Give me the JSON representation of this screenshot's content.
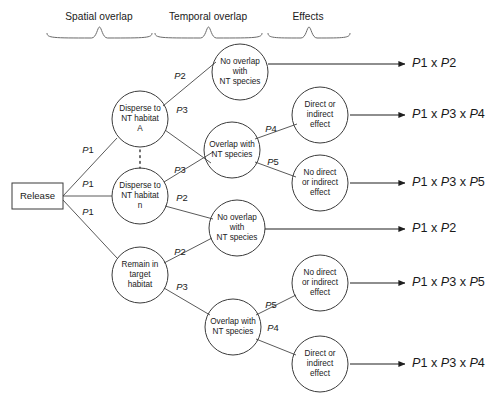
{
  "diagram": {
    "headers": [
      {
        "id": "spatial",
        "label": "Spatial overlap",
        "x": 99,
        "brace_x1": 47,
        "brace_x2": 152
      },
      {
        "id": "temporal",
        "label": "Temporal overlap",
        "x": 208,
        "brace_x1": 155,
        "brace_x2": 262
      },
      {
        "id": "effects",
        "label": "Effects",
        "x": 308,
        "brace_x1": 268,
        "brace_x2": 350
      }
    ],
    "start_box": {
      "label": "Release",
      "x": 12,
      "y": 183,
      "w": 51,
      "h": 26
    },
    "nodes": [
      {
        "id": "disperse-a",
        "lines": [
          "Disperse to",
          "NT habitat",
          "A"
        ],
        "cx": 140,
        "cy": 119,
        "r": 28
      },
      {
        "id": "disperse-n",
        "lines": [
          "Disperse to",
          "NT habitat",
          "n"
        ],
        "cx": 140,
        "cy": 196,
        "r": 28
      },
      {
        "id": "remain-target",
        "lines": [
          "Remain in",
          "target",
          "habitat"
        ],
        "cx": 140,
        "cy": 275,
        "r": 28
      },
      {
        "id": "no-overlap-1",
        "lines": [
          "No overlap",
          "with",
          "NT species"
        ],
        "cx": 240,
        "cy": 72,
        "r": 28
      },
      {
        "id": "overlap-1",
        "lines": [
          "Overlap with",
          "NT species"
        ],
        "cx": 232,
        "cy": 150,
        "r": 28
      },
      {
        "id": "no-overlap-2",
        "lines": [
          "No overlap",
          "with",
          "NT species"
        ],
        "cx": 237,
        "cy": 228,
        "r": 28
      },
      {
        "id": "overlap-2",
        "lines": [
          "Overlap with",
          "NT species"
        ],
        "cx": 233,
        "cy": 327,
        "r": 28
      },
      {
        "id": "effect-direct-1",
        "lines": [
          "Direct or",
          "indirect",
          "effect"
        ],
        "cx": 320,
        "cy": 115,
        "r": 28
      },
      {
        "id": "effect-nodirect-1",
        "lines": [
          "No direct",
          "or indirect",
          "effect"
        ],
        "cx": 320,
        "cy": 183,
        "r": 28
      },
      {
        "id": "effect-nodirect-2",
        "lines": [
          "No direct",
          "or indirect",
          "effect"
        ],
        "cx": 320,
        "cy": 283,
        "r": 28
      },
      {
        "id": "effect-direct-2",
        "lines": [
          "Direct or",
          "indirect",
          "effect"
        ],
        "cx": 320,
        "cy": 364,
        "r": 28
      }
    ],
    "edges": [
      {
        "id": "release-to-disperse-a",
        "x1": 63,
        "y1": 196,
        "x2": 117,
        "y2": 138
      },
      {
        "id": "release-to-disperse-n",
        "x1": 63,
        "y1": 196,
        "x2": 112,
        "y2": 196
      },
      {
        "id": "release-to-remain",
        "x1": 63,
        "y1": 200,
        "x2": 117,
        "y2": 258
      },
      {
        "id": "disperse-a-to-no-overlap",
        "x1": 163,
        "y1": 106,
        "x2": 216,
        "y2": 62
      },
      {
        "id": "disperse-a-to-overlap",
        "x1": 165,
        "y1": 130,
        "x2": 211,
        "y2": 163
      },
      {
        "id": "disperse-n-to-overlap",
        "x1": 164,
        "y1": 182,
        "x2": 213,
        "y2": 152
      },
      {
        "id": "disperse-n-to-no-overlap2",
        "x1": 165,
        "y1": 206,
        "x2": 213,
        "y2": 219
      },
      {
        "id": "remain-to-no-overlap2",
        "x1": 164,
        "y1": 263,
        "x2": 212,
        "y2": 238
      },
      {
        "id": "remain-to-overlap2",
        "x1": 164,
        "y1": 288,
        "x2": 210,
        "y2": 315
      },
      {
        "id": "overlap1-to-direct",
        "x1": 255,
        "y1": 139,
        "x2": 297,
        "y2": 124
      },
      {
        "id": "overlap1-to-nodirect",
        "x1": 255,
        "y1": 162,
        "x2": 296,
        "y2": 177
      },
      {
        "id": "overlap2-to-nodirect",
        "x1": 256,
        "y1": 315,
        "x2": 296,
        "y2": 295
      },
      {
        "id": "overlap2-to-direct",
        "x1": 256,
        "y1": 339,
        "x2": 296,
        "y2": 355
      }
    ],
    "dotted_link": {
      "x": 140,
      "y1": 150,
      "y2": 168
    },
    "probabilities": [
      {
        "id": "p1-top",
        "prefix": "P",
        "suffix": "1",
        "x": 88,
        "y": 151
      },
      {
        "id": "p1-mid",
        "prefix": "P",
        "suffix": "1",
        "x": 88,
        "y": 185
      },
      {
        "id": "p1-bot",
        "prefix": "P",
        "suffix": "1",
        "x": 88,
        "y": 213
      },
      {
        "id": "p2-disperse-a",
        "prefix": "P",
        "suffix": "2",
        "x": 180,
        "y": 77
      },
      {
        "id": "p3-disperse-a",
        "prefix": "P",
        "suffix": "3",
        "x": 182,
        "y": 111
      },
      {
        "id": "p3-disperse-n",
        "prefix": "P",
        "suffix": "3",
        "x": 180,
        "y": 171
      },
      {
        "id": "p2-disperse-n",
        "prefix": "P",
        "suffix": "2",
        "x": 182,
        "y": 199
      },
      {
        "id": "p2-remain",
        "prefix": "P",
        "suffix": "2",
        "x": 180,
        "y": 253
      },
      {
        "id": "p3-remain",
        "prefix": "P",
        "suffix": "3",
        "x": 182,
        "y": 288
      },
      {
        "id": "p4-overlap1",
        "prefix": "P",
        "suffix": "4",
        "x": 271,
        "y": 130
      },
      {
        "id": "p5-overlap1",
        "prefix": "P",
        "suffix": "5",
        "x": 273,
        "y": 163
      },
      {
        "id": "p5-overlap2",
        "prefix": "P",
        "suffix": "5",
        "x": 271,
        "y": 306
      },
      {
        "id": "p4-overlap2",
        "prefix": "P",
        "suffix": "4",
        "x": 273,
        "y": 329
      }
    ],
    "outcome_arrows": [
      {
        "id": "arrow-1",
        "x1": 268,
        "x2": 405,
        "y": 64
      },
      {
        "id": "arrow-2",
        "x1": 350,
        "x2": 405,
        "y": 115
      },
      {
        "id": "arrow-3",
        "x1": 350,
        "x2": 405,
        "y": 183
      },
      {
        "id": "arrow-4",
        "x1": 265,
        "x2": 405,
        "y": 229
      },
      {
        "id": "arrow-5",
        "x1": 350,
        "x2": 405,
        "y": 283
      },
      {
        "id": "arrow-6",
        "x1": 350,
        "x2": 405,
        "y": 364
      }
    ],
    "outcomes": [
      {
        "id": "outcome-1",
        "terms": [
          "P1",
          "P2"
        ],
        "text": "P1 x P2",
        "x": 412,
        "y": 64
      },
      {
        "id": "outcome-2",
        "terms": [
          "P1",
          "P3",
          "P4"
        ],
        "text": "P1 x P3 x P4",
        "x": 412,
        "y": 115
      },
      {
        "id": "outcome-3",
        "terms": [
          "P1",
          "P3",
          "P5"
        ],
        "text": "P1 x P3 x P5",
        "x": 412,
        "y": 183
      },
      {
        "id": "outcome-4",
        "terms": [
          "P1",
          "P2"
        ],
        "text": "P1 x P2",
        "x": 412,
        "y": 229
      },
      {
        "id": "outcome-5",
        "terms": [
          "P1",
          "P3",
          "P5"
        ],
        "text": "P1 x P3 x P5",
        "x": 412,
        "y": 283
      },
      {
        "id": "outcome-6",
        "terms": [
          "P1",
          "P3",
          "P4"
        ],
        "text": "P1 x P3 x P4",
        "x": 412,
        "y": 364
      }
    ],
    "colors": {
      "background": "#ffffff",
      "shape_stroke": "#3b3b3b",
      "connector_stroke": "#5a5a5a",
      "arrow_stroke": "#1f1f1f",
      "text": "#1a1a1a"
    }
  }
}
